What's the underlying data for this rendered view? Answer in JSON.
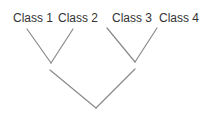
{
  "diagram": {
    "type": "tree",
    "leaves": [
      {
        "label": "Class 1",
        "x": 13,
        "y": 12
      },
      {
        "label": "Class 2",
        "x": 58,
        "y": 12
      },
      {
        "label": "Class 3",
        "x": 112,
        "y": 12
      },
      {
        "label": "Class 4",
        "x": 159,
        "y": 12
      }
    ],
    "edges": [
      {
        "from": "Class 1",
        "to": "node-left",
        "x1": 27,
        "y1": 29,
        "x2": 51,
        "y2": 63
      },
      {
        "from": "Class 2",
        "to": "node-left",
        "x1": 73,
        "y1": 29,
        "x2": 51,
        "y2": 63
      },
      {
        "from": "Class 3",
        "to": "node-right",
        "x1": 107,
        "y1": 28,
        "x2": 135,
        "y2": 62
      },
      {
        "from": "Class 4",
        "to": "node-right",
        "x1": 157,
        "y1": 28,
        "x2": 135,
        "y2": 62
      },
      {
        "from": "node-left",
        "to": "root",
        "x1": 50,
        "y1": 70,
        "x2": 96,
        "y2": 108
      },
      {
        "from": "node-right",
        "to": "root",
        "x1": 135,
        "y1": 69,
        "x2": 96,
        "y2": 108
      }
    ],
    "line_color": "#8a8a8a",
    "text_color": "#333333"
  }
}
